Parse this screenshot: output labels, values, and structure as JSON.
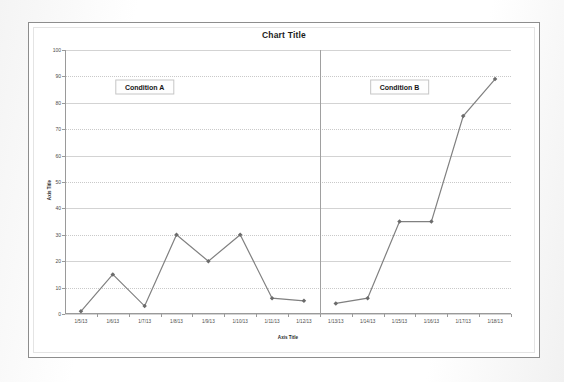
{
  "chart": {
    "title": "Chart Title",
    "y_axis_title": "Axis Title",
    "x_axis_title": "Axis Title",
    "annotations": [
      {
        "label": "Condition A"
      },
      {
        "label": "Condition B"
      }
    ]
  },
  "chart_data": {
    "type": "line",
    "title": "Chart Title",
    "xlabel": "Axis Title",
    "ylabel": "Axis Title",
    "ylim": [
      0,
      100
    ],
    "yticks": [
      0,
      10,
      20,
      30,
      40,
      50,
      60,
      70,
      80,
      90,
      100
    ],
    "grid": true,
    "legend": "none",
    "x": [
      "1/5/13",
      "1/6/13",
      "1/7/13",
      "1/8/13",
      "1/9/13",
      "1/10/13",
      "1/11/13",
      "1/12/13",
      "1/13/13",
      "1/14/13",
      "1/15/13",
      "1/16/13",
      "1/17/13",
      "1/18/13"
    ],
    "series": [
      {
        "name": "Condition A",
        "x": [
          "1/5/13",
          "1/6/13",
          "1/7/13",
          "1/8/13",
          "1/9/13",
          "1/10/13",
          "1/11/13",
          "1/12/13"
        ],
        "values": [
          1,
          15,
          3,
          30,
          20,
          30,
          6,
          5
        ]
      },
      {
        "name": "Condition B",
        "x": [
          "1/13/13",
          "1/14/13",
          "1/15/13",
          "1/16/13",
          "1/17/13",
          "1/18/13"
        ],
        "values": [
          4,
          6,
          35,
          35,
          75,
          89
        ]
      }
    ],
    "annotations": [
      {
        "text": "Condition A",
        "x": "1/7/13",
        "y": 86
      },
      {
        "text": "Condition B",
        "x": "1/15/13",
        "y": 86
      }
    ],
    "phase_divider_between": [
      "1/12/13",
      "1/13/13"
    ],
    "line_color": "#808080",
    "marker": "diamond"
  }
}
